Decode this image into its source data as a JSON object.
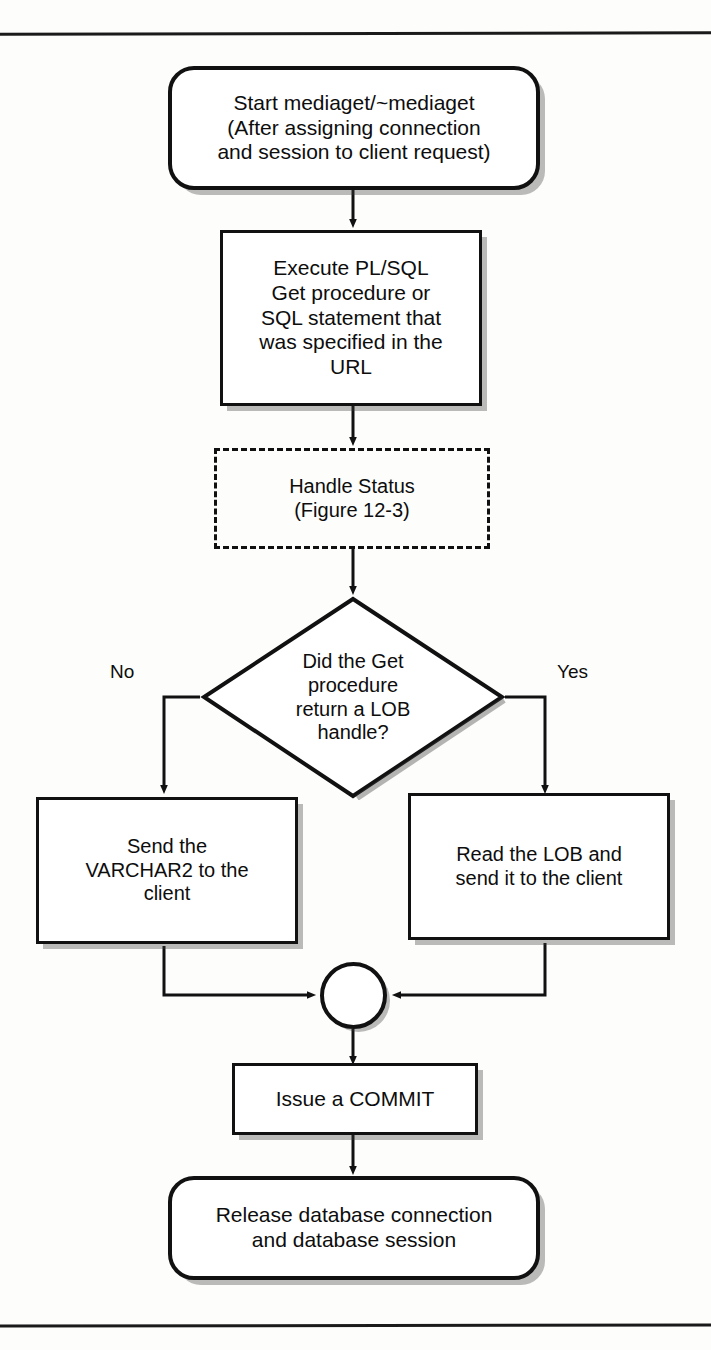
{
  "page": {
    "background_color": "#fdfdfc",
    "ink_color": "#111111",
    "has_top_rule": true,
    "has_bottom_rule": true
  },
  "diagram": {
    "type": "flowchart",
    "orientation": "top-to-bottom",
    "nodes": [
      {
        "id": "start",
        "shape": "terminator",
        "text": "Start mediaget/~mediaget\n(After assigning connection\nand session to client request)"
      },
      {
        "id": "execute",
        "shape": "process",
        "text": "Execute PL/SQL\nGet procedure or\nSQL statement that\nwas specified in the\nURL"
      },
      {
        "id": "handle_status",
        "shape": "predefined-process-dashed",
        "text": "Handle Status\n(Figure 12-3)"
      },
      {
        "id": "decision",
        "shape": "decision",
        "text": "Did the Get\nprocedure\nreturn a LOB\nhandle?"
      },
      {
        "id": "send_varchar2",
        "shape": "process",
        "text": "Send the\nVARCHAR2 to the\nclient"
      },
      {
        "id": "read_lob",
        "shape": "process",
        "text": "Read the LOB and\nsend it to the client"
      },
      {
        "id": "merge",
        "shape": "connector-circle",
        "text": ""
      },
      {
        "id": "commit",
        "shape": "process",
        "text": "Issue a COMMIT"
      },
      {
        "id": "release",
        "shape": "terminator",
        "text": "Release database connection\nand database session"
      }
    ],
    "edges": [
      {
        "from": "start",
        "to": "execute",
        "label": ""
      },
      {
        "from": "execute",
        "to": "handle_status",
        "label": ""
      },
      {
        "from": "handle_status",
        "to": "decision",
        "label": ""
      },
      {
        "from": "decision",
        "to": "send_varchar2",
        "label": "No"
      },
      {
        "from": "decision",
        "to": "read_lob",
        "label": "Yes"
      },
      {
        "from": "send_varchar2",
        "to": "merge",
        "label": ""
      },
      {
        "from": "read_lob",
        "to": "merge",
        "label": ""
      },
      {
        "from": "merge",
        "to": "commit",
        "label": ""
      },
      {
        "from": "commit",
        "to": "release",
        "label": ""
      }
    ],
    "labels": {
      "no": "No",
      "yes": "Yes"
    }
  }
}
